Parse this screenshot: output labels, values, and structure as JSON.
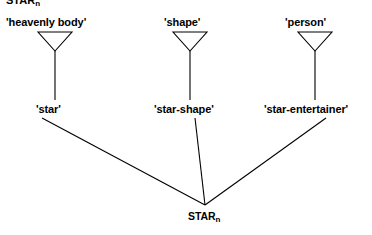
{
  "figure": {
    "type": "linguistic-tree-diagram",
    "background_color": "#ffffff",
    "stroke_color": "#000000",
    "text_color": "#000000",
    "cutoff_heading": {
      "text": "STAR",
      "subscript": "n",
      "note": "partially cropped text at very top edge"
    },
    "root": {
      "text": "STAR",
      "subscript": "n"
    },
    "senses": [
      {
        "label": "'heavenly body'"
      },
      {
        "label": "'shape'"
      },
      {
        "label": "'person'"
      }
    ],
    "forms": [
      {
        "label": "'star'"
      },
      {
        "label": "'star-shape'"
      },
      {
        "label": "'star-entertainer'"
      }
    ]
  }
}
